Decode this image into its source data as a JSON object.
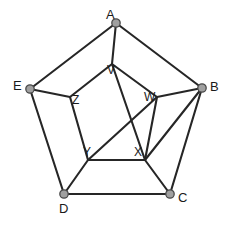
{
  "figure": {
    "width": 230,
    "height": 225,
    "background_color": "#ffffff"
  },
  "style": {
    "edge_color": "#262626",
    "edge_width": 2.1,
    "node_fill": "#a0a0a0",
    "node_stroke": "#4a4a4a",
    "node_radius": 4.2,
    "label_color": "#1a1a1a"
  },
  "nodes": [
    {
      "id": "A",
      "label": "A",
      "kind": "outer",
      "x": 116,
      "y": 23,
      "label_x": 106,
      "label_y": 8,
      "marker": "dot"
    },
    {
      "id": "B",
      "label": "B",
      "kind": "outer",
      "x": 202,
      "y": 88,
      "label_x": 210,
      "label_y": 80,
      "marker": "dot"
    },
    {
      "id": "C",
      "label": "C",
      "kind": "outer",
      "x": 170,
      "y": 194,
      "label_x": 178,
      "label_y": 191,
      "marker": "dot"
    },
    {
      "id": "D",
      "label": "D",
      "kind": "outer",
      "x": 64,
      "y": 194,
      "label_x": 59,
      "label_y": 202,
      "marker": "dot"
    },
    {
      "id": "E",
      "label": "E",
      "kind": "outer",
      "x": 30,
      "y": 89,
      "label_x": 13,
      "label_y": 79,
      "marker": "dot"
    },
    {
      "id": "V",
      "label": "V",
      "kind": "inner",
      "x": 112,
      "y": 64,
      "label_x": 107,
      "label_y": 64,
      "marker": "none"
    },
    {
      "id": "W",
      "label": "W",
      "kind": "inner",
      "x": 157,
      "y": 97,
      "label_x": 144,
      "label_y": 91,
      "marker": "none"
    },
    {
      "id": "X",
      "label": "X",
      "kind": "inner",
      "x": 145,
      "y": 160,
      "label_x": 134,
      "label_y": 146,
      "marker": "none"
    },
    {
      "id": "Y",
      "label": "Y",
      "kind": "inner",
      "x": 88,
      "y": 160,
      "label_x": 83,
      "label_y": 146,
      "marker": "none"
    },
    {
      "id": "Z",
      "label": "Z",
      "kind": "inner",
      "x": 70,
      "y": 97,
      "label_x": 72,
      "label_y": 94,
      "marker": "none"
    }
  ],
  "edges": [
    {
      "from": "A",
      "to": "B",
      "name": "edge-A-B"
    },
    {
      "from": "B",
      "to": "C",
      "name": "edge-B-C"
    },
    {
      "from": "C",
      "to": "D",
      "name": "edge-C-D"
    },
    {
      "from": "D",
      "to": "E",
      "name": "edge-D-E"
    },
    {
      "from": "E",
      "to": "A",
      "name": "edge-E-A"
    },
    {
      "from": "A",
      "to": "V",
      "name": "edge-A-V"
    },
    {
      "from": "B",
      "to": "W",
      "name": "edge-B-W"
    },
    {
      "from": "B",
      "to": "X",
      "name": "edge-B-X"
    },
    {
      "from": "C",
      "to": "X",
      "name": "edge-C-X"
    },
    {
      "from": "D",
      "to": "Y",
      "name": "edge-D-Y"
    },
    {
      "from": "E",
      "to": "Z",
      "name": "edge-E-Z"
    },
    {
      "from": "V",
      "to": "W",
      "name": "edge-V-W"
    },
    {
      "from": "V",
      "to": "Z",
      "name": "edge-V-Z"
    },
    {
      "from": "W",
      "to": "X",
      "name": "edge-W-X"
    },
    {
      "from": "X",
      "to": "Y",
      "name": "edge-X-Y"
    },
    {
      "from": "Y",
      "to": "Z",
      "name": "edge-Y-Z"
    },
    {
      "from": "V",
      "to": "X",
      "name": "edge-V-X"
    },
    {
      "from": "Y",
      "to": "W",
      "name": "edge-Y-W"
    }
  ]
}
